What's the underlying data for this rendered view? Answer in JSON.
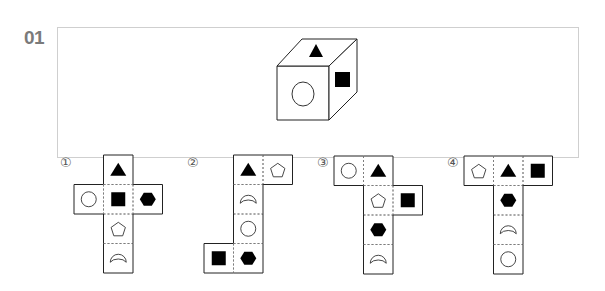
{
  "question": {
    "number": "01",
    "cube": {
      "faces": {
        "top": "filled-triangle",
        "front": "hollow-circle",
        "right": "filled-square"
      }
    }
  },
  "options": [
    {
      "label": "①",
      "net": [
        {
          "r": 0,
          "c": 1,
          "shape": "filled-triangle"
        },
        {
          "r": 1,
          "c": 0,
          "shape": "hollow-circle"
        },
        {
          "r": 1,
          "c": 1,
          "shape": "filled-square"
        },
        {
          "r": 1,
          "c": 2,
          "shape": "filled-hexagon"
        },
        {
          "r": 2,
          "c": 1,
          "shape": "hollow-pentagon"
        },
        {
          "r": 3,
          "c": 1,
          "shape": "hollow-crescent"
        }
      ]
    },
    {
      "label": "②",
      "net": [
        {
          "r": 0,
          "c": 1,
          "shape": "filled-triangle"
        },
        {
          "r": 0,
          "c": 2,
          "shape": "hollow-pentagon"
        },
        {
          "r": 1,
          "c": 1,
          "shape": "hollow-crescent"
        },
        {
          "r": 2,
          "c": 1,
          "shape": "hollow-circle"
        },
        {
          "r": 3,
          "c": 0,
          "shape": "filled-square"
        },
        {
          "r": 3,
          "c": 1,
          "shape": "filled-hexagon"
        }
      ]
    },
    {
      "label": "③",
      "net": [
        {
          "r": 0,
          "c": 0,
          "shape": "hollow-circle"
        },
        {
          "r": 0,
          "c": 1,
          "shape": "filled-triangle"
        },
        {
          "r": 1,
          "c": 1,
          "shape": "hollow-pentagon"
        },
        {
          "r": 1,
          "c": 2,
          "shape": "filled-square"
        },
        {
          "r": 2,
          "c": 1,
          "shape": "filled-hexagon"
        },
        {
          "r": 3,
          "c": 1,
          "shape": "hollow-crescent"
        }
      ]
    },
    {
      "label": "④",
      "net": [
        {
          "r": 0,
          "c": 0,
          "shape": "hollow-pentagon"
        },
        {
          "r": 0,
          "c": 1,
          "shape": "filled-triangle"
        },
        {
          "r": 0,
          "c": 2,
          "shape": "filled-square"
        },
        {
          "r": 1,
          "c": 1,
          "shape": "filled-hexagon"
        },
        {
          "r": 2,
          "c": 1,
          "shape": "hollow-crescent"
        },
        {
          "r": 3,
          "c": 1,
          "shape": "hollow-circle"
        }
      ]
    }
  ]
}
